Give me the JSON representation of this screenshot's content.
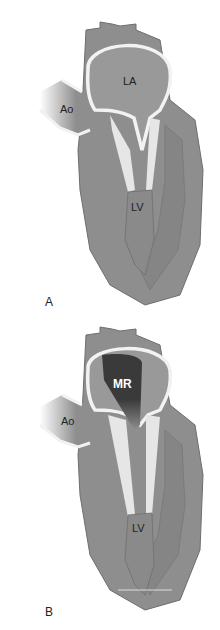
{
  "figure": {
    "panels": [
      {
        "id": "A",
        "letter": "A",
        "labels": {
          "la": "LA",
          "ao": "Ao",
          "lv": "LV"
        }
      },
      {
        "id": "B",
        "letter": "B",
        "labels": {
          "mr": "MR",
          "ao": "Ao",
          "lv": "LV"
        }
      }
    ]
  },
  "colors": {
    "tissue": "#8e8e8e",
    "tissue_dark": "#7a7a7a",
    "chamber": "#999999",
    "wall_highlight": "#f2f2f2",
    "regurgitant_jet": "#3a3a3a",
    "background": "#ffffff"
  }
}
